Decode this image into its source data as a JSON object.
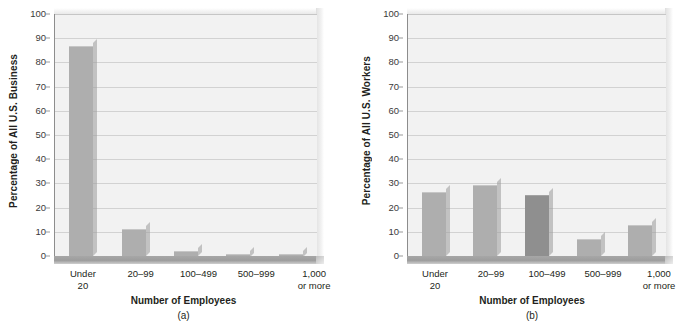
{
  "figure": {
    "panels": [
      "a",
      "b"
    ]
  },
  "chart_data": [
    {
      "type": "bar",
      "panel_label": "(a)",
      "title": "",
      "xlabel": "Number of Employees",
      "ylabel": "Percentage of All U.S. Business",
      "ylim": [
        0,
        100
      ],
      "yticks": [
        0,
        10,
        20,
        30,
        40,
        50,
        60,
        70,
        80,
        90,
        100
      ],
      "grid": true,
      "legend": "none",
      "categories": [
        "Under 20",
        "20–99",
        "100–499",
        "500–999",
        "1,000 or more"
      ],
      "category_lines": [
        [
          "Under",
          "20"
        ],
        [
          "20–99",
          ""
        ],
        [
          "100–499",
          ""
        ],
        [
          "500–999",
          ""
        ],
        [
          "1,000",
          "or more"
        ]
      ],
      "values": [
        86.5,
        10.7,
        1.6,
        0.5,
        0.4
      ],
      "bar_colors": [
        "#aeaeae",
        "#aeaeae",
        "#aeaeae",
        "#aeaeae",
        "#aeaeae"
      ]
    },
    {
      "type": "bar",
      "panel_label": "(b)",
      "title": "",
      "xlabel": "Number of Employees",
      "ylabel": "Percentage of All U.S. Workers",
      "ylim": [
        0,
        100
      ],
      "yticks": [
        0,
        10,
        20,
        30,
        40,
        50,
        60,
        70,
        80,
        90,
        100
      ],
      "grid": true,
      "legend": "none",
      "categories": [
        "Under 20",
        "20–99",
        "100–499",
        "500–999",
        "1,000 or more"
      ],
      "category_lines": [
        [
          "Under",
          "20"
        ],
        [
          "20–99",
          ""
        ],
        [
          "100–499",
          ""
        ],
        [
          "500–999",
          ""
        ],
        [
          "1,000",
          "or more"
        ]
      ],
      "values": [
        26.0,
        28.8,
        24.6,
        6.8,
        12.6
      ],
      "bar_colors": [
        "#aeaeae",
        "#aeaeae",
        "#8f8f8f",
        "#aeaeae",
        "#aeaeae"
      ]
    }
  ],
  "colors": {
    "bar_light": "#aeaeae",
    "bar_dark": "#8f8f8f",
    "plot_background": "#f2f2f2",
    "gridline": "#d2d2d2",
    "axis": "#8d8d8d",
    "text": "#231f20"
  }
}
